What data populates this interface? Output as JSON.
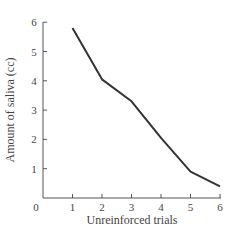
{
  "chart_data": {
    "type": "line",
    "title": "",
    "xlabel": "Unreinforced trials",
    "ylabel": "Amount of saliva (cc)",
    "x": [
      1,
      2,
      3,
      4,
      5,
      6
    ],
    "series": [
      {
        "name": "Amount of saliva",
        "values": [
          5.8,
          4.05,
          3.3,
          2.05,
          0.9,
          0.4
        ]
      }
    ],
    "xlim": [
      0,
      6
    ],
    "ylim": [
      0,
      6
    ],
    "xticks": [
      "0",
      "1",
      "2",
      "3",
      "4",
      "5",
      "6"
    ],
    "yticks": [
      "1",
      "2",
      "3",
      "4",
      "5",
      "6"
    ],
    "grid": false,
    "legend": null,
    "line_color": "#333333"
  }
}
